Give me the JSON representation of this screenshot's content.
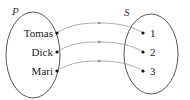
{
  "diagram": {
    "type": "mapping",
    "domain_set": {
      "name": "P",
      "elements": [
        "Tomas",
        "Dick",
        "Mari"
      ]
    },
    "codomain_set": {
      "name": "S",
      "elements": [
        "1",
        "2",
        "3"
      ]
    },
    "mappings": [
      {
        "from": "Tomas",
        "to": "1"
      },
      {
        "from": "Dick",
        "to": "2"
      },
      {
        "from": "Mari",
        "to": "3"
      }
    ],
    "colors": {
      "ellipse": "#444444",
      "arrow": "#999999",
      "text": "#222222"
    }
  }
}
